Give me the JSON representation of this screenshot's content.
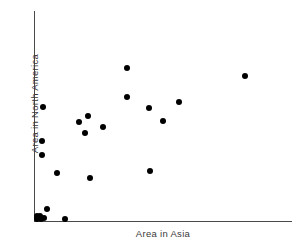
{
  "chart_data": {
    "type": "scatter",
    "title": "",
    "xlabel": "Area in Asia",
    "ylabel": "Area in North America",
    "grid": false,
    "legend": null,
    "axis_style": "open-L (left spine and bottom spine only)",
    "tick_labels": {
      "x": [],
      "y": []
    },
    "xlim": [
      0,
      1
    ],
    "ylim": [
      0,
      1
    ],
    "marker": {
      "shape": "circle",
      "filled": true,
      "color": "#000000",
      "size_px": 6
    },
    "axis_color": "#4a4a4a",
    "label_color": "#3a3a3a",
    "n_points": 23,
    "points": [
      {
        "px": 245,
        "py": 76,
        "x": 0.818,
        "y": 0.69
      },
      {
        "px": 127,
        "py": 68,
        "x": 0.36,
        "y": 0.728
      },
      {
        "px": 127,
        "py": 97,
        "x": 0.36,
        "y": 0.59
      },
      {
        "px": 179,
        "py": 102,
        "x": 0.562,
        "y": 0.566
      },
      {
        "px": 149,
        "py": 108,
        "x": 0.446,
        "y": 0.536
      },
      {
        "px": 43,
        "py": 107,
        "x": 0.035,
        "y": 0.54
      },
      {
        "px": 163,
        "py": 121,
        "x": 0.5,
        "y": 0.474
      },
      {
        "px": 88,
        "py": 116,
        "x": 0.209,
        "y": 0.498
      },
      {
        "px": 79,
        "py": 122,
        "x": 0.175,
        "y": 0.469
      },
      {
        "px": 85,
        "py": 133,
        "x": 0.198,
        "y": 0.417
      },
      {
        "px": 103,
        "py": 127,
        "x": 0.268,
        "y": 0.446
      },
      {
        "px": 42,
        "py": 141,
        "x": 0.031,
        "y": 0.379
      },
      {
        "px": 42,
        "py": 155,
        "x": 0.031,
        "y": 0.312
      },
      {
        "px": 57,
        "py": 173,
        "x": 0.089,
        "y": 0.227
      },
      {
        "px": 90,
        "py": 178,
        "x": 0.217,
        "y": 0.203
      },
      {
        "px": 150,
        "py": 171,
        "x": 0.45,
        "y": 0.237
      },
      {
        "px": 47,
        "py": 209,
        "x": 0.05,
        "y": 0.057
      },
      {
        "px": 37,
        "py": 216,
        "x": 0.012,
        "y": 0.024
      },
      {
        "px": 40,
        "py": 216,
        "x": 0.023,
        "y": 0.024
      },
      {
        "px": 37,
        "py": 219,
        "x": 0.012,
        "y": 0.009
      },
      {
        "px": 41,
        "py": 219,
        "x": 0.027,
        "y": 0.009
      },
      {
        "px": 44,
        "py": 218,
        "x": 0.039,
        "y": 0.014
      },
      {
        "px": 65,
        "py": 219,
        "x": 0.12,
        "y": 0.009
      }
    ]
  }
}
